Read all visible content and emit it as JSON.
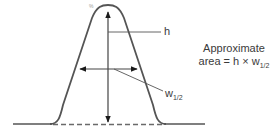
{
  "diagram": {
    "peak_marker": "%",
    "height_label": "h",
    "width_label_main": "w",
    "width_label_sub": "1/2",
    "approx_line1": "Approximate",
    "approx_line2_prefix": "area = h × w",
    "approx_line2_sub": "1/2",
    "colors": {
      "stroke": "#4a4a4a",
      "text": "#3a3a3a",
      "dash": "#6a6a6a"
    }
  }
}
